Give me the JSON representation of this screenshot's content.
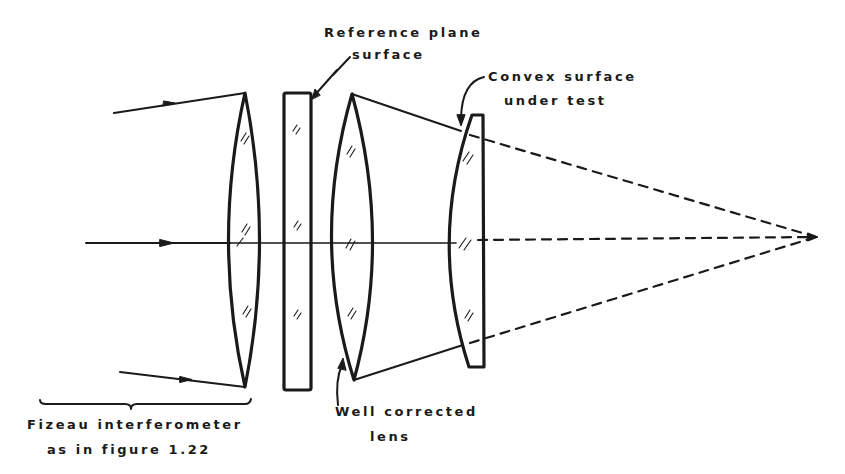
{
  "figure": {
    "type": "optical-setup"
  },
  "labels": {
    "reference_plane_line1": "Reference plane",
    "reference_plane_line2": "surface",
    "convex_line1": "Convex surface",
    "convex_line2": "under test",
    "fizeau_line1": "Fizeau  interferometer",
    "fizeau_line2": "as  in  figure 1.22",
    "well_corrected_line1": "Well corrected",
    "well_corrected_line2": "lens"
  },
  "elements": [
    {
      "name": "collimating-lens",
      "kind": "biconvex lens"
    },
    {
      "name": "reference-plate",
      "kind": "plane parallel plate"
    },
    {
      "name": "well-corrected-lens",
      "kind": "biconvex lens"
    },
    {
      "name": "test-piece",
      "kind": "convex surface under test"
    }
  ],
  "colors": {
    "ink": "#1a1a1a",
    "background": "#ffffff"
  }
}
